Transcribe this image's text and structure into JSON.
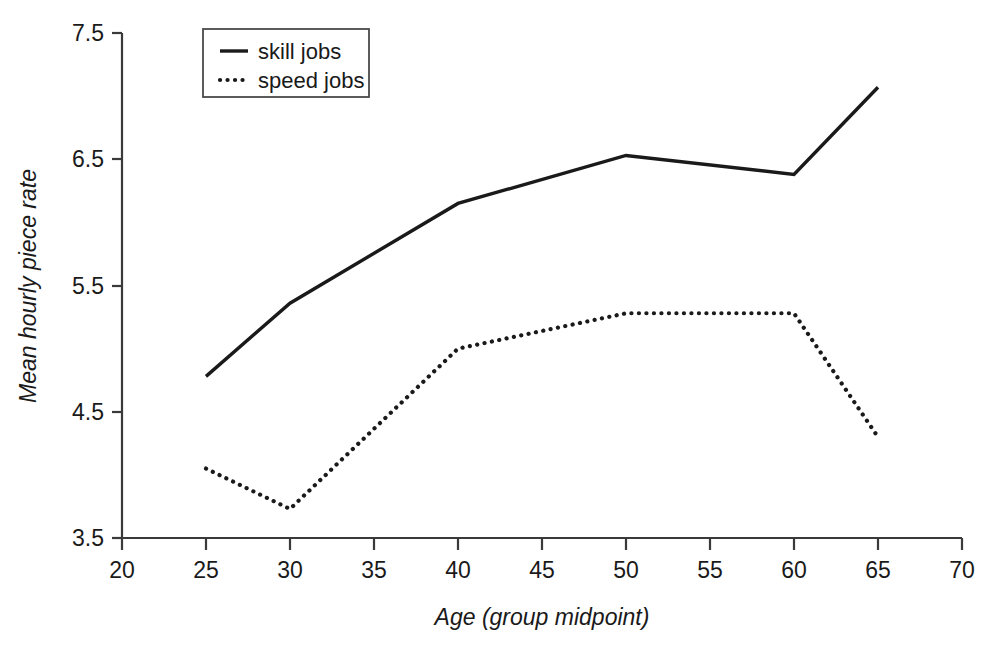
{
  "chart_data": {
    "type": "line",
    "title": "",
    "subtitle": "",
    "xlabel": "Age (group midpoint)",
    "ylabel": "Mean hourly piece rate",
    "xlim": [
      20,
      70
    ],
    "ylim": [
      3.5,
      7.5
    ],
    "xticks": [
      20,
      25,
      30,
      35,
      40,
      45,
      50,
      55,
      60,
      65,
      70
    ],
    "yticks": [
      3.5,
      4.5,
      5.5,
      6.5,
      7.5
    ],
    "xtick_labels": [
      "20",
      "25",
      "30",
      "35",
      "40",
      "45",
      "50",
      "55",
      "60",
      "65",
      "70"
    ],
    "ytick_labels": [
      "3.5",
      "4.5",
      "5.5",
      "6.5",
      "7.5"
    ],
    "grid": false,
    "legend_position": "top-left-inside",
    "x": [
      25,
      30,
      40,
      50,
      60,
      65
    ],
    "series": [
      {
        "name": "skill jobs",
        "style": "solid",
        "color": "#1a1a1a",
        "values": [
          4.78,
          5.36,
          6.15,
          6.53,
          6.38,
          7.07
        ]
      },
      {
        "name": "speed jobs",
        "style": "dotted",
        "color": "#1a1a1a",
        "values": [
          4.05,
          3.73,
          5.0,
          5.28,
          5.28,
          4.3
        ]
      }
    ],
    "legend": [
      {
        "label": "skill jobs",
        "style": "solid"
      },
      {
        "label": "speed jobs",
        "style": "dotted"
      }
    ]
  },
  "axes": {
    "x_title": "Age (group midpoint)",
    "y_title": "Mean hourly piece rate"
  },
  "legend": {
    "entry_0_label": "skill jobs",
    "entry_1_label": "speed jobs"
  },
  "ticks": {
    "y": [
      "7.5",
      "6.5",
      "5.5",
      "4.5",
      "3.5"
    ],
    "x": [
      "20",
      "25",
      "30",
      "35",
      "40",
      "45",
      "50",
      "55",
      "60",
      "65",
      "70"
    ]
  },
  "colors": {
    "ink": "#1a1a1a",
    "axis": "#3a3a3a",
    "background": "#ffffff"
  }
}
